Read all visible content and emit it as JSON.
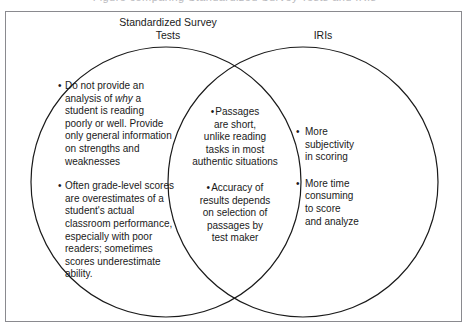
{
  "figure": {
    "clipped_caption_above": "Figure comparing Standardized Survey Tests and IRIs",
    "type": "venn-diagram",
    "border_color": "#8a8a8f",
    "circle_stroke_color": "#1a1a1a",
    "text_color": "#1a1a1a",
    "background_color": "#ffffff"
  },
  "headings": {
    "left": "Standardized Survey\nTests",
    "right": "IRIs"
  },
  "left_circle": {
    "label": "Standardized Survey Tests",
    "bullet_marker": "•",
    "items": [
      {
        "pre": "Do not provide an\nanalysis of ",
        "italic": "why",
        "post": " a\nstudent is reading\npoorly or well. Provide\nonly general information\non strengths and\nweaknesses"
      },
      {
        "text": "Often grade-level scores\nare overestimates of a\nstudent's actual\nclassroom performance,\nespecially with poor\nreaders; sometimes\nscores underestimate\nability."
      }
    ]
  },
  "overlap": {
    "label": "Shared by both",
    "bullet_marker": "•",
    "items": [
      {
        "text": "Passages\nare short,\nunlike reading\ntasks in most\nauthentic situations"
      },
      {
        "text": "Accuracy of\nresults depends\non selection of\npassages by\ntest maker"
      }
    ]
  },
  "right_circle": {
    "label": "IRIs",
    "bullet_marker": "•",
    "items": [
      {
        "text": "More\nsubjectivity\nin scoring"
      },
      {
        "text": "More time\nconsuming\nto score\nand analyze"
      }
    ]
  }
}
